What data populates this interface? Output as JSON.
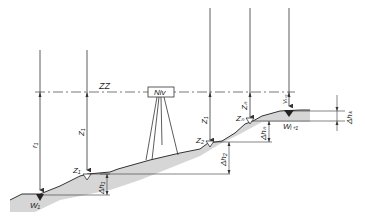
{
  "diagram": {
    "type": "levelling-profile",
    "line_of_sight_label": "ZZ",
    "instrument_label": "Niv",
    "labels": {
      "r1": "r₁",
      "z1_vert": "Z₁",
      "z1_pt": "Z₁",
      "z2_vert": "Z₁",
      "z2_pt": "Z₂",
      "zn_vert": "Zₙ",
      "zn_pt": "Zₙ",
      "v_next": "Vᵢ₊₁",
      "w1": "W₁",
      "w_next": "Wᵢ₊₁",
      "dh1": "Δh₁",
      "dh2": "Δh₂",
      "dhn": "Δhₙ",
      "dhk": "Δhₖ"
    },
    "colors": {
      "line": "#333333",
      "ground_fill": "#d8d8d8"
    }
  }
}
